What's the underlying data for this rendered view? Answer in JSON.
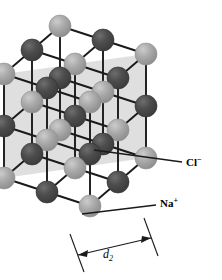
{
  "figure": {
    "type": "crystal-lattice-diagram",
    "background_color": "#ffffff"
  },
  "legend": {
    "anion": {
      "symbol": "Cl",
      "charge": "−",
      "label": "Cl−",
      "color": "#4d4d4d",
      "marker_x": 168,
      "marker_y": 162
    },
    "cation": {
      "symbol": "Na",
      "charge": "+",
      "label": "Na+",
      "color": "#a9a9a9",
      "marker_x": 142,
      "marker_y": 203
    }
  },
  "dimension": {
    "label": "d",
    "subscript": "2",
    "full_label": "d2",
    "start_x": 78,
    "end_x": 152,
    "start_y": 258,
    "end_y": 240
  },
  "colors": {
    "cation_fill": "#a9a9a9",
    "cation_highlight": "#c4c4c4",
    "cation_shadow": "#8e8e8e",
    "anion_fill": "#4d4d4d",
    "anion_highlight": "#6b6b6b",
    "anion_shadow": "#3a3a3a",
    "bond": "#1a1a1a",
    "plane_shade": "#d9d9d9",
    "outline": "#000000"
  },
  "chart_data": {
    "type": "scatter",
    "xlabel": "",
    "ylabel": "",
    "projection": "axonometric",
    "grid_size": [
      3,
      3,
      3
    ],
    "axis_vectors": {
      "a_dx": 43,
      "a_dy": 14,
      "b_dx": -28,
      "b_dy": 24,
      "c_dx": 0,
      "c_dy": 52
    },
    "origin": [
      60,
      26
    ],
    "sphere_radius": 11,
    "ion_order": [
      "Na",
      "Cl"
    ],
    "shaded_plane": {
      "fill": "#d9d9d9",
      "description": "diagonal (110) plane through lattice"
    }
  }
}
